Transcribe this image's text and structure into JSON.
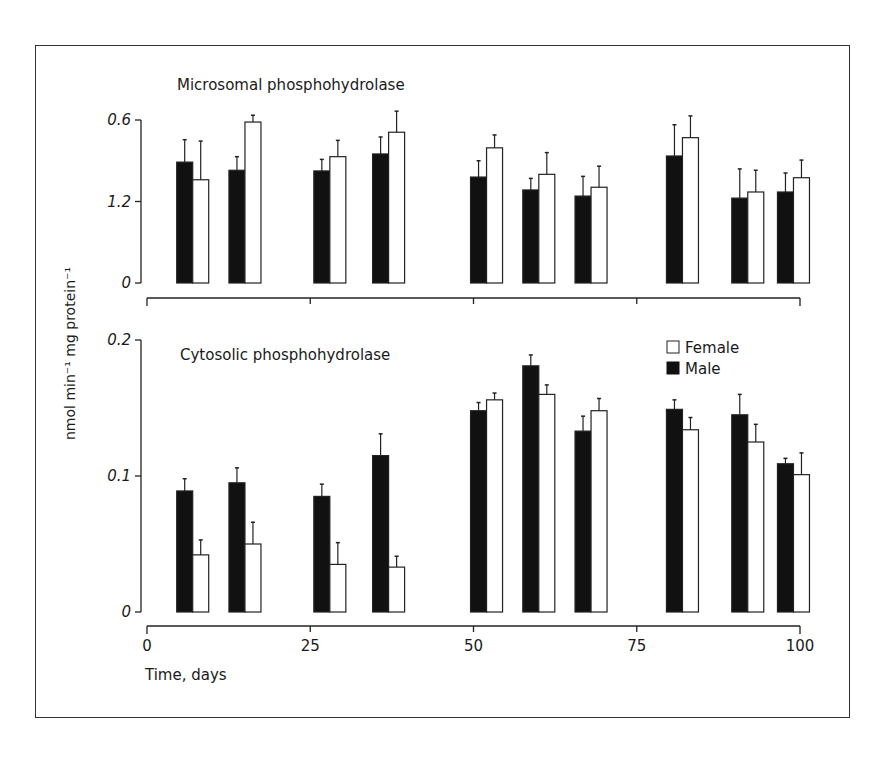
{
  "figure": {
    "y_axis_label": "nmol min⁻¹  mg protein⁻¹",
    "x_axis_label": "Time, days",
    "legend": [
      {
        "label": "Female",
        "fill": "#ffffff"
      },
      {
        "label": "Male",
        "fill": "#111111"
      }
    ]
  },
  "chart_data": [
    {
      "type": "bar",
      "title": "Microsomal phosphohydrolase",
      "xlabel": "Time, days",
      "ylabel": "nmol min-1 mg protein-1",
      "ytick_labels": [
        "0",
        "1.2",
        "0.6"
      ],
      "ytick_positions": [
        0,
        1.2,
        2.4
      ],
      "ylim": [
        0,
        2.4
      ],
      "xlim": [
        0,
        100
      ],
      "xticks": [
        0,
        25,
        50,
        75,
        100
      ],
      "x": [
        7,
        15,
        28,
        37,
        52,
        60,
        68,
        82,
        92,
        99
      ],
      "series": [
        {
          "name": "Male",
          "color": "#111111",
          "values": [
            1.78,
            1.66,
            1.65,
            1.9,
            1.56,
            1.37,
            1.28,
            1.87,
            1.25,
            1.34
          ],
          "errors": [
            0.33,
            0.2,
            0.17,
            0.25,
            0.24,
            0.17,
            0.29,
            0.46,
            0.43,
            0.28
          ]
        },
        {
          "name": "Female",
          "color": "#ffffff",
          "values": [
            1.52,
            2.37,
            1.86,
            2.22,
            1.99,
            1.6,
            1.41,
            2.14,
            1.34,
            1.55
          ],
          "errors": [
            0.57,
            0.1,
            0.24,
            0.31,
            0.19,
            0.32,
            0.31,
            0.32,
            0.32,
            0.26
          ]
        }
      ],
      "grid": false
    },
    {
      "type": "bar",
      "title": "Cytosolic phosphohydrolase",
      "xlabel": "Time, days",
      "ylabel": "nmol min-1 mg protein-1",
      "ytick_labels": [
        "0",
        "0.1",
        "0.2"
      ],
      "ytick_positions": [
        0,
        0.1,
        0.2
      ],
      "ylim": [
        0,
        0.2
      ],
      "xlim": [
        0,
        100
      ],
      "xticks": [
        0,
        25,
        50,
        75,
        100
      ],
      "xtick_labels": [
        "0",
        "25",
        "50",
        "75",
        "100"
      ],
      "x": [
        7,
        15,
        28,
        37,
        52,
        60,
        68,
        82,
        92,
        99
      ],
      "series": [
        {
          "name": "Male",
          "color": "#111111",
          "values": [
            0.089,
            0.095,
            0.085,
            0.115,
            0.148,
            0.181,
            0.133,
            0.149,
            0.145,
            0.109
          ],
          "errors": [
            0.009,
            0.011,
            0.009,
            0.016,
            0.006,
            0.008,
            0.011,
            0.007,
            0.015,
            0.004
          ]
        },
        {
          "name": "Female",
          "color": "#ffffff",
          "values": [
            0.042,
            0.05,
            0.035,
            0.033,
            0.156,
            0.16,
            0.148,
            0.134,
            0.125,
            0.101
          ],
          "errors": [
            0.011,
            0.016,
            0.016,
            0.008,
            0.005,
            0.007,
            0.009,
            0.009,
            0.013,
            0.016
          ]
        }
      ],
      "legend_position": "upper right",
      "grid": false
    }
  ]
}
